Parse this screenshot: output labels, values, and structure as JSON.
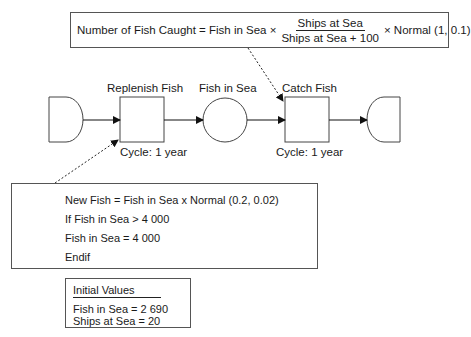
{
  "formula": {
    "lhs": "Number of Fish Caught = Fish in Sea ×",
    "numerator": "Ships at Sea",
    "denominator": "Ships at Sea +  100",
    "rhs": "×  Normal (1, 0.1)"
  },
  "nodes": {
    "replenish": {
      "label": "Replenish Fish",
      "cycle": "Cycle: 1 year"
    },
    "stock": {
      "label": "Fish in Sea"
    },
    "catch": {
      "label": "Catch Fish",
      "cycle": "Cycle: 1 year"
    }
  },
  "logic": {
    "lines": [
      "New Fish = Fish in Sea x Normal (0.2, 0.02)",
      "If Fish in Sea > 4 000",
      "Fish in Sea = 4 000",
      "Endif"
    ]
  },
  "initial_values": {
    "title": "Initial Values",
    "lines": [
      "Fish in Sea = 2 690",
      "Ships at Sea = 20"
    ]
  }
}
